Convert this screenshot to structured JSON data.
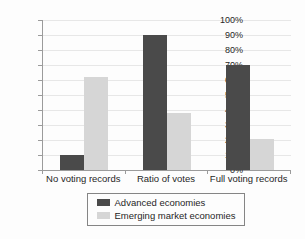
{
  "chart_data": {
    "type": "bar",
    "title": "",
    "categories": [
      "No voting records",
      "Ratio of votes",
      "Full voting records"
    ],
    "series": [
      {
        "name": "Advanced economies",
        "color": "#4a4a4a",
        "values": [
          10,
          90,
          70
        ]
      },
      {
        "name": "Emerging market economies",
        "color": "#d6d6d6",
        "values": [
          62,
          38,
          21
        ]
      }
    ],
    "ylabel": "",
    "xlabel": "",
    "ylim": [
      0,
      100
    ],
    "ytick_step": 10,
    "ytick_labels": [
      "0%",
      "10%",
      "20%",
      "30%",
      "40%",
      "50%",
      "60%",
      "70%",
      "80%",
      "90%",
      "100%"
    ],
    "grid": "horizontal",
    "legend_position": "bottom",
    "legend_border": true
  },
  "colors": {
    "axis": "#9b9b9b",
    "gridline": "#e7e7e7",
    "text": "#262626",
    "background": "#fdfdfd",
    "legend_border": "#858585"
  }
}
